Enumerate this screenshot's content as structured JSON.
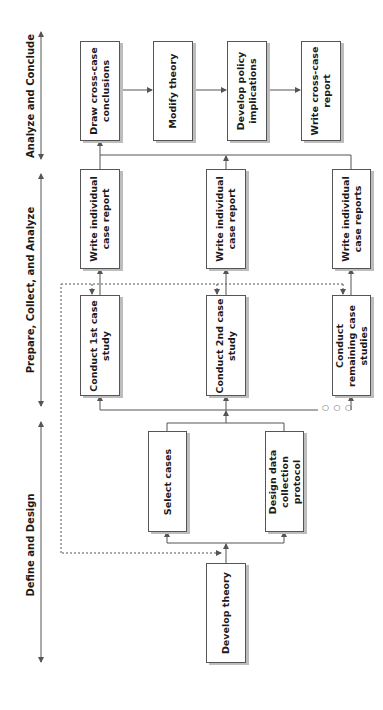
{
  "phases": [
    {
      "id": "analyze",
      "label": "Analyze and Conclude"
    },
    {
      "id": "prepare",
      "label": "Prepare, Collect, and Analyze"
    },
    {
      "id": "define",
      "label": "Define and Design"
    }
  ],
  "boxes": {
    "develop_theory": "Develop theory",
    "select_cases": "Select cases",
    "design_protocol": "Design data collection protocol",
    "conduct_1": "Conduct 1st case study",
    "conduct_2": "Conduct 2nd case study",
    "conduct_rest": "Conduct remaining case studies",
    "report_1": "Write individual case report",
    "report_2": "Write individual case report",
    "report_rest": "Write individual case reports",
    "draw_conclusions": "Draw cross-case conclusions",
    "modify_theory": "Modify theory",
    "policy_implications": "Develop policy implications",
    "cross_case_report": "Write cross-case report"
  },
  "ellipsis": "○ ○ ○",
  "colors": {
    "line": "#555555",
    "shadow": "#bdbdbd",
    "text": "#1a1a1a"
  }
}
